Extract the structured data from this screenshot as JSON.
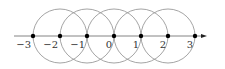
{
  "diagram": {
    "type": "number-line-with-circles",
    "axis": {
      "y": 36,
      "x_start": 14,
      "x_end": 207,
      "arrow": "right",
      "color": "#777777"
    },
    "unit_px": 27,
    "origin_x": 114,
    "points": [
      {
        "value": -3,
        "label": "−3"
      },
      {
        "value": -2,
        "label": "−2"
      },
      {
        "value": -1,
        "label": "−1"
      },
      {
        "value": 0,
        "label": "0"
      },
      {
        "value": 1,
        "label": "1"
      },
      {
        "value": 2,
        "label": "2"
      },
      {
        "value": 3,
        "label": "3"
      }
    ],
    "circles": [
      {
        "center": -2,
        "radius_units": 1
      },
      {
        "center": -1,
        "radius_units": 1
      },
      {
        "center": 0,
        "radius_units": 1
      },
      {
        "center": 1,
        "radius_units": 1
      },
      {
        "center": 2,
        "radius_units": 1
      }
    ],
    "colors": {
      "circle_stroke": "#9a9a9a",
      "point_fill": "#000000",
      "label": "#333333"
    }
  }
}
